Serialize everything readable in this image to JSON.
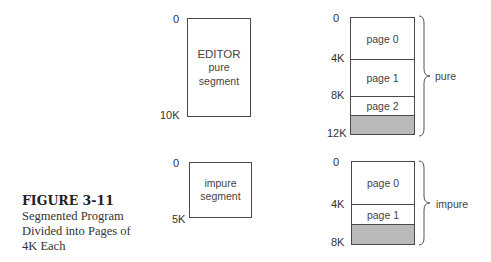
{
  "figure": {
    "number_label": "FIGURE 3-11",
    "caption_lines": [
      "Segmented Program",
      "Divided into Pages of",
      "4K Each"
    ]
  },
  "editor_segment": {
    "lines": [
      "EDITOR",
      "pure",
      "segment"
    ],
    "start_label": "0",
    "end_label": "10K"
  },
  "impure_segment": {
    "lines": [
      "impure",
      "segment"
    ],
    "start_label": "0",
    "end_label": "5K"
  },
  "pure_pages": {
    "address_labels": [
      "0",
      "4K",
      "8K",
      "12K"
    ],
    "pages": [
      "page 0",
      "page 1",
      "page 2"
    ],
    "brace_label": "pure",
    "shaded_color": "#b9b9b9"
  },
  "impure_pages": {
    "address_labels": [
      "0",
      "4K",
      "8K"
    ],
    "pages": [
      "page 0",
      "page 1"
    ],
    "brace_label": "impure",
    "shaded_color": "#b9b9b9"
  }
}
